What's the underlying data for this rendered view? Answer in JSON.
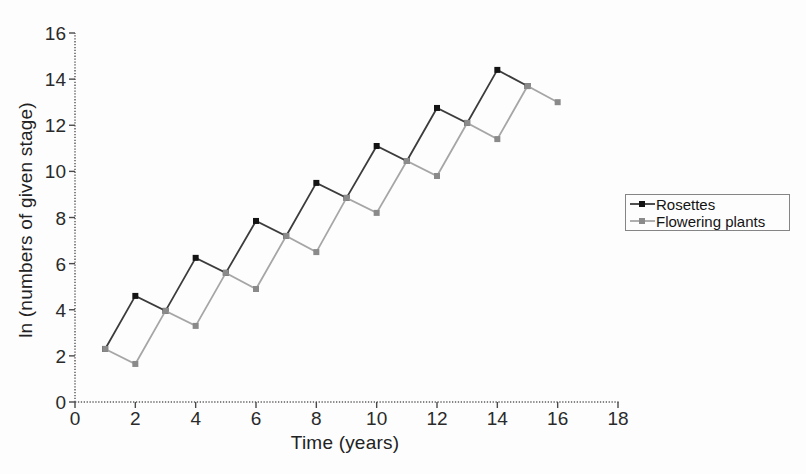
{
  "figure": {
    "background_color": "#fdfdfd",
    "axis_color": "#5e5e5e",
    "tick_text_color": "#2a2a2a",
    "legend_border_color": "#858585"
  },
  "chart_data": {
    "type": "line",
    "title": "",
    "xlabel": "Time (years)",
    "ylabel": "ln (numbers of given stage)",
    "xlim": [
      0,
      18
    ],
    "ylim": [
      0,
      16
    ],
    "x_ticks": [
      0,
      2,
      4,
      6,
      8,
      10,
      12,
      14,
      16,
      18
    ],
    "y_ticks": [
      0,
      2,
      4,
      6,
      8,
      10,
      12,
      14,
      16
    ],
    "grid": false,
    "legend_position": "outside-right",
    "series": [
      {
        "name": "Rosettes",
        "color": "#3c3c3c",
        "marker": "square",
        "marker_color": "#141414",
        "x": [
          1,
          2,
          3,
          4,
          5,
          6,
          7,
          8,
          9,
          10,
          11,
          12,
          13,
          14,
          15
        ],
        "y": [
          2.3,
          4.6,
          3.95,
          6.25,
          5.6,
          7.85,
          7.2,
          9.5,
          8.85,
          11.1,
          10.45,
          12.75,
          12.1,
          14.4,
          13.7
        ]
      },
      {
        "name": "Flowering plants",
        "color": "#a6a6a6",
        "marker": "square",
        "marker_color": "#8a8a8a",
        "x": [
          1,
          2,
          3,
          4,
          5,
          6,
          7,
          8,
          9,
          10,
          11,
          12,
          13,
          14,
          15,
          16
        ],
        "y": [
          2.3,
          1.65,
          3.95,
          3.3,
          5.6,
          4.9,
          7.2,
          6.5,
          8.85,
          8.2,
          10.45,
          9.8,
          12.1,
          11.4,
          13.7,
          13.0
        ]
      }
    ]
  }
}
